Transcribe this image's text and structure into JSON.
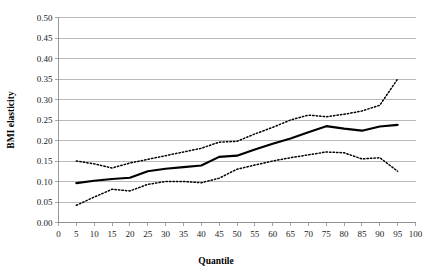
{
  "chart_data": {
    "type": "line",
    "title": "",
    "xlabel": "Quantile",
    "ylabel": "BMI elasticity",
    "xlim": [
      0,
      100
    ],
    "ylim": [
      0,
      0.5
    ],
    "grid": true,
    "legend": "none",
    "x_ticks": [
      0,
      5,
      10,
      15,
      20,
      25,
      30,
      35,
      40,
      45,
      50,
      55,
      60,
      65,
      70,
      75,
      80,
      85,
      90,
      95,
      100
    ],
    "x_tick_labels": [
      "0",
      "5",
      "10",
      "15",
      "20",
      "25",
      "30",
      "35",
      "40",
      "45",
      "50",
      "55",
      "60",
      "65",
      "70",
      "75",
      "80",
      "85",
      "90",
      "95",
      "100"
    ],
    "y_ticks": [
      0.0,
      0.05,
      0.1,
      0.15,
      0.2,
      0.25,
      0.3,
      0.35,
      0.4,
      0.45,
      0.5
    ],
    "y_tick_labels": [
      "0.00",
      "0.05",
      "0.10",
      "0.15",
      "0.20",
      "0.25",
      "0.30",
      "0.35",
      "0.40",
      "0.45",
      "0.50"
    ],
    "x": [
      5,
      10,
      15,
      20,
      25,
      30,
      35,
      40,
      45,
      50,
      55,
      60,
      65,
      70,
      75,
      80,
      85,
      90,
      95
    ],
    "series": [
      {
        "name": "BMI elasticity estimate",
        "style": "solid",
        "values": [
          0.096,
          0.102,
          0.106,
          0.109,
          0.125,
          0.131,
          0.135,
          0.139,
          0.16,
          0.163,
          0.178,
          0.192,
          0.205,
          0.22,
          0.235,
          0.229,
          0.224,
          0.234,
          0.238
        ]
      },
      {
        "name": "Upper confidence bound",
        "style": "dashed",
        "values": [
          0.15,
          0.143,
          0.133,
          0.145,
          0.154,
          0.163,
          0.172,
          0.181,
          0.196,
          0.198,
          0.216,
          0.232,
          0.25,
          0.262,
          0.258,
          0.264,
          0.272,
          0.286,
          0.35
        ]
      },
      {
        "name": "Lower confidence bound",
        "style": "dashed",
        "values": [
          0.042,
          0.062,
          0.081,
          0.077,
          0.093,
          0.1,
          0.1,
          0.097,
          0.108,
          0.13,
          0.14,
          0.15,
          0.158,
          0.165,
          0.172,
          0.17,
          0.155,
          0.158,
          0.125
        ]
      }
    ]
  }
}
